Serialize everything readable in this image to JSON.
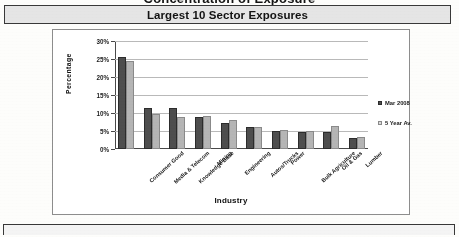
{
  "document": {
    "title": "Concentration of Exposure",
    "subtitle": "Largest 10 Sector Exposures"
  },
  "chart_data": {
    "type": "bar",
    "title": "Largest 10 Sector Exposures",
    "xlabel": "Industry",
    "ylabel": "Percentage",
    "ylim": [
      0,
      30
    ],
    "yticks": [
      "0%",
      "5%",
      "10%",
      "15%",
      "20%",
      "25%",
      "30%"
    ],
    "ytick_values": [
      0,
      5,
      10,
      15,
      20,
      25,
      30
    ],
    "grid": true,
    "legend_position": "right",
    "categories": [
      "Consumer Good",
      "Media & Telecom",
      "Knowledge Base",
      "Mining",
      "Engineering",
      "Autos/Trucks",
      "Power",
      "Bulk Agriculture",
      "Oil & Gas",
      "Lumber"
    ],
    "series": [
      {
        "name": "Mar 2008",
        "color": "#4f4f4f",
        "values": [
          25.5,
          11.5,
          11.5,
          8.8,
          7.2,
          6.0,
          5.0,
          4.8,
          4.8,
          3.0
        ]
      },
      {
        "name": "5 Year Av.",
        "color": "#b4b4b4",
        "values": [
          24.5,
          9.6,
          9.0,
          9.2,
          8.0,
          6.2,
          5.2,
          5.0,
          6.5,
          3.2
        ]
      }
    ]
  },
  "legend": {
    "items": [
      {
        "label": "Mar 2008"
      },
      {
        "label": "5 Year Av."
      }
    ]
  }
}
